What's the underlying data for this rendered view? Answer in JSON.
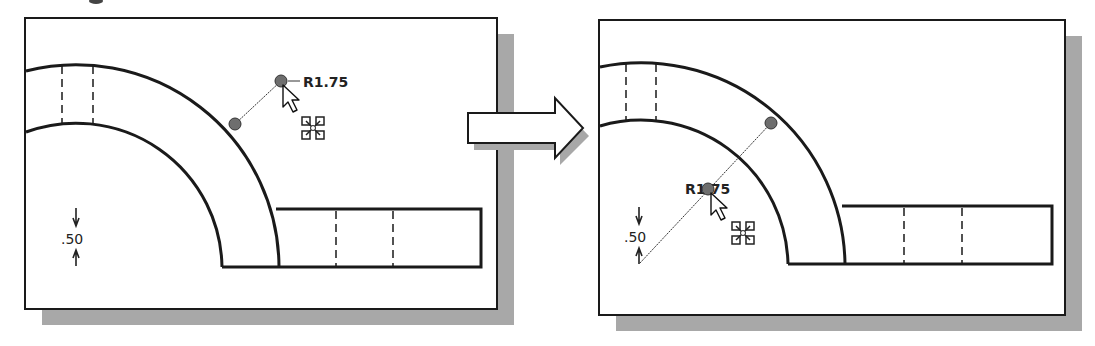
{
  "figure": {
    "colors": {
      "outline": "#1a1a1a",
      "shadow": "#a8a8a8",
      "dot": "#6e6e6e",
      "background": "#ffffff"
    }
  },
  "panels": [
    {
      "id": "before",
      "radius_dimension": {
        "label": "R1.75"
      },
      "linear_dimension": {
        "label": ".50"
      },
      "cursor": {
        "icon": "arrow-pointer-icon",
        "modifier": "move-icon"
      }
    },
    {
      "id": "after",
      "radius_dimension": {
        "label": "R1.75"
      },
      "linear_dimension": {
        "label": ".50"
      },
      "cursor": {
        "icon": "arrow-pointer-icon",
        "modifier": "move-icon"
      }
    }
  ],
  "transition_arrow": {
    "icon": "right-arrow-icon"
  }
}
